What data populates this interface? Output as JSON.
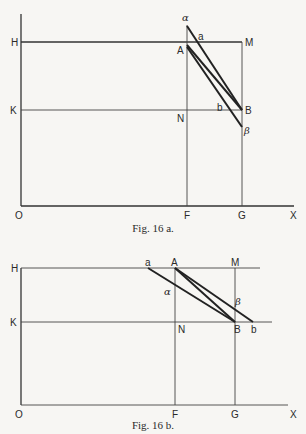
{
  "figures": [
    {
      "id": "fig16a",
      "caption": "Fig. 16 a.",
      "labels": {
        "alpha": "α",
        "a": "a",
        "H": "H",
        "M": "M",
        "A": "A",
        "K": "K",
        "N": "N",
        "b": "b",
        "B": "B",
        "beta": "β",
        "O": "O",
        "F": "F",
        "G": "G",
        "X": "X"
      }
    },
    {
      "id": "fig16b",
      "caption": "Fig. 16 b.",
      "labels": {
        "H": "H",
        "a": "a",
        "A": "A",
        "M": "M",
        "alpha": "α",
        "beta": "β",
        "K": "K",
        "N": "N",
        "B": "B",
        "b": "b",
        "O": "O",
        "F": "F",
        "G": "G",
        "X": "X"
      }
    }
  ]
}
